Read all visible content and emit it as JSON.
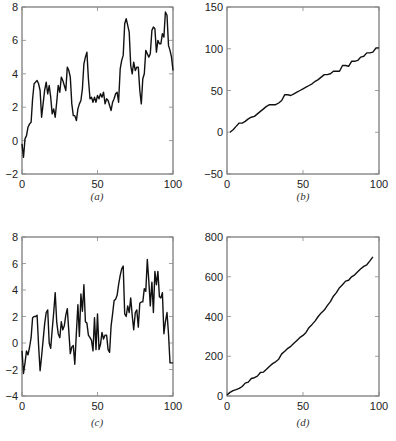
{
  "chart_data": [
    {
      "id": "a",
      "type": "line",
      "caption": "(a)",
      "title": "",
      "xlabel": "",
      "ylabel": "",
      "xlim": [
        0,
        100
      ],
      "ylim": [
        -2,
        8
      ],
      "xticks": [
        0,
        50,
        100
      ],
      "yticks": [
        -2,
        0,
        2,
        4,
        6,
        8
      ],
      "grid": false,
      "frame": {
        "left": 22,
        "top": 7,
        "right": 173,
        "bottom": 174
      },
      "caption_pos": {
        "x": 97,
        "y": 200
      },
      "series": [
        {
          "name": "a",
          "x": [
            0,
            1,
            2,
            3,
            4,
            5,
            6,
            7,
            8,
            9,
            10,
            11,
            12,
            13,
            14,
            15,
            16,
            17,
            18,
            19,
            20,
            21,
            22,
            23,
            24,
            25,
            26,
            27,
            28,
            29,
            30,
            31,
            32,
            33,
            34,
            35,
            36,
            37,
            38,
            39,
            40,
            41,
            42,
            43,
            44,
            45,
            46,
            47,
            48,
            49,
            50,
            51,
            52,
            53,
            54,
            55,
            56,
            57,
            58,
            59,
            60,
            61,
            62,
            63,
            64,
            65,
            66,
            67,
            68,
            69,
            70,
            71,
            72,
            73,
            74,
            75,
            76,
            77,
            78,
            79,
            80,
            81,
            82,
            83,
            84,
            85,
            86,
            87,
            88,
            89,
            90,
            91,
            92,
            93,
            94,
            95,
            96,
            97,
            98,
            99,
            100
          ],
          "y": [
            -0.2,
            -1.0,
            0.1,
            0.3,
            0.8,
            1.0,
            1.1,
            2.5,
            3.4,
            3.5,
            3.6,
            3.4,
            3.0,
            1.4,
            2.2,
            3.0,
            3.5,
            2.8,
            3.3,
            2.6,
            1.6,
            1.9,
            1.4,
            2.3,
            3.3,
            2.9,
            3.8,
            3.6,
            3.3,
            3.0,
            4.4,
            4.2,
            3.8,
            2.2,
            1.5,
            1.5,
            1.2,
            1.9,
            2.2,
            2.4,
            3.1,
            4.6,
            5.0,
            5.3,
            3.7,
            2.5,
            2.6,
            2.3,
            2.6,
            2.3,
            2.7,
            2.5,
            2.8,
            2.6,
            2.9,
            2.2,
            2.5,
            2.4,
            2.1,
            1.8,
            2.3,
            2.5,
            2.8,
            2.9,
            2.3,
            4.3,
            4.8,
            5.1,
            7.0,
            7.3,
            6.9,
            6.5,
            4.5,
            4.0,
            4.7,
            4.2,
            4.4,
            4.4,
            3.0,
            2.2,
            3.7,
            4.0,
            5.4,
            5.2,
            5.0,
            5.2,
            6.6,
            6.8,
            6.7,
            5.3,
            6.0,
            5.8,
            5.8,
            6.4,
            6.2,
            7.7,
            7.5,
            5.7,
            5.4,
            5.0,
            4.2,
            4.0
          ]
        }
      ]
    },
    {
      "id": "b",
      "type": "line",
      "caption": "(b)",
      "title": "",
      "xlabel": "",
      "ylabel": "",
      "xlim": [
        0,
        100
      ],
      "ylim": [
        -50,
        150
      ],
      "xticks": [
        0,
        50,
        100
      ],
      "yticks": [
        -50,
        0,
        50,
        100,
        150
      ],
      "grid": false,
      "frame": {
        "left": 227,
        "top": 7,
        "right": 379,
        "bottom": 174
      },
      "caption_pos": {
        "x": 303,
        "y": 200
      },
      "series": [
        {
          "name": "b",
          "x": [
            2,
            4,
            6,
            8,
            10,
            12,
            14,
            16,
            18,
            20,
            22,
            24,
            26,
            28,
            30,
            32,
            34,
            36,
            38,
            40,
            42,
            44,
            46,
            48,
            50,
            52,
            54,
            56,
            58,
            60,
            62,
            64,
            66,
            68,
            70,
            72,
            74,
            76,
            78,
            80,
            82,
            84,
            86,
            88,
            90,
            92,
            94,
            96,
            98,
            100
          ],
          "y": [
            0,
            3,
            7,
            11,
            11,
            13,
            16,
            18,
            19,
            22,
            25,
            28,
            31,
            33,
            33,
            33,
            35,
            38,
            45,
            45,
            44,
            46,
            48,
            50,
            52,
            54,
            56,
            58,
            61,
            63,
            66,
            69,
            69,
            70,
            73,
            73,
            73,
            80,
            80,
            79,
            85,
            85,
            86,
            90,
            91,
            95,
            95,
            96,
            101,
            101
          ]
        }
      ]
    },
    {
      "id": "c",
      "type": "line",
      "caption": "(c)",
      "title": "",
      "xlabel": "",
      "ylabel": "",
      "xlim": [
        0,
        100
      ],
      "ylim": [
        -4,
        8
      ],
      "xticks": [
        0,
        50,
        100
      ],
      "yticks": [
        -4,
        -2,
        0,
        2,
        4,
        6,
        8
      ],
      "grid": false,
      "frame": {
        "left": 22,
        "top": 237,
        "right": 173,
        "bottom": 396
      },
      "caption_pos": {
        "x": 97,
        "y": 426
      },
      "series": [
        {
          "name": "c",
          "x": [
            0,
            1,
            2,
            3,
            4,
            5,
            6,
            7,
            8,
            9,
            10,
            11,
            12,
            13,
            14,
            15,
            16,
            17,
            18,
            19,
            20,
            21,
            22,
            23,
            24,
            25,
            26,
            27,
            28,
            29,
            30,
            31,
            32,
            33,
            34,
            35,
            36,
            37,
            38,
            39,
            40,
            41,
            42,
            43,
            44,
            45,
            46,
            47,
            48,
            49,
            50,
            51,
            52,
            53,
            54,
            55,
            56,
            57,
            58,
            59,
            60,
            61,
            62,
            63,
            64,
            65,
            66,
            67,
            68,
            69,
            70,
            71,
            72,
            73,
            74,
            75,
            76,
            77,
            78,
            79,
            80,
            81,
            82,
            83,
            84,
            85,
            86,
            87,
            88,
            89,
            90,
            91,
            92,
            93,
            94,
            95,
            96,
            97,
            98,
            99,
            100
          ],
          "y": [
            -0.6,
            -2.3,
            -1.5,
            -0.6,
            -0.9,
            -0.3,
            0.4,
            1.9,
            2.0,
            2.0,
            2.1,
            -0.2,
            -2.1,
            -1.0,
            0.2,
            1.4,
            2.3,
            2.5,
            0.0,
            -0.4,
            1.0,
            2.3,
            3.8,
            1.6,
            0.7,
            0.4,
            1.6,
            1.0,
            1.3,
            2.1,
            2.6,
            0.9,
            -0.8,
            -0.3,
            -0.2,
            -1.6,
            0.8,
            2.9,
            0.5,
            3.7,
            2.4,
            4.4,
            1.6,
            1.5,
            0.6,
            0.4,
            0.2,
            -0.6,
            1.9,
            -0.5,
            2.2,
            -0.5,
            -0.1,
            0.8,
            0.3,
            0.6,
            0.6,
            -0.5,
            -0.7,
            1.3,
            2.2,
            3.2,
            3.3,
            3.6,
            4.4,
            5.1,
            5.6,
            5.8,
            2.2,
            2.0,
            2.8,
            2.3,
            3.4,
            2.1,
            1.0,
            2.3,
            2.5,
            1.2,
            3.0,
            3.1,
            3.1,
            4.1,
            3.9,
            6.3,
            4.7,
            2.8,
            4.6,
            2.3,
            5.4,
            4.4,
            5.4,
            3.5,
            3.4,
            3.8,
            0.7,
            1.6,
            2.3,
            0.7,
            -1.5,
            -1.5,
            -1.5
          ]
        }
      ]
    },
    {
      "id": "d",
      "type": "line",
      "caption": "(d)",
      "title": "",
      "xlabel": "",
      "ylabel": "",
      "xlim": [
        0,
        100
      ],
      "ylim": [
        0,
        800
      ],
      "xticks": [
        0,
        50,
        100
      ],
      "yticks": [
        0,
        200,
        400,
        600,
        800
      ],
      "grid": false,
      "frame": {
        "left": 227,
        "top": 237,
        "right": 379,
        "bottom": 396
      },
      "caption_pos": {
        "x": 303,
        "y": 426
      },
      "series": [
        {
          "name": "d",
          "x": [
            0,
            2,
            4,
            6,
            8,
            10,
            12,
            14,
            16,
            18,
            20,
            22,
            24,
            26,
            28,
            30,
            32,
            34,
            36,
            38,
            40,
            42,
            44,
            46,
            48,
            50,
            52,
            54,
            56,
            58,
            60,
            62,
            64,
            66,
            68,
            70,
            72,
            74,
            76,
            78,
            80,
            82,
            84,
            86,
            88,
            90,
            92,
            94,
            96
          ],
          "y": [
            5,
            18,
            27,
            32,
            38,
            48,
            65,
            70,
            88,
            92,
            100,
            118,
            120,
            135,
            150,
            163,
            172,
            185,
            212,
            225,
            240,
            250,
            265,
            280,
            295,
            305,
            320,
            345,
            360,
            378,
            400,
            418,
            432,
            455,
            475,
            502,
            520,
            545,
            560,
            578,
            582,
            600,
            610,
            625,
            640,
            652,
            660,
            680,
            700
          ]
        }
      ]
    }
  ]
}
